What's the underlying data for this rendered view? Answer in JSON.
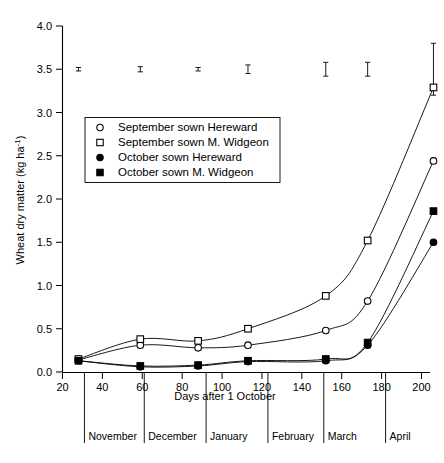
{
  "chart_data": {
    "type": "line",
    "title": "",
    "xlabel": "Days after 1 October",
    "ylabel": "Wheat dry matter (kg ha-1)",
    "ylabel_display": "Wheat dry matter (kg ha",
    "ylabel_exponent": "-1",
    "ylabel_tail": ")",
    "xlim": [
      20,
      210
    ],
    "ylim": [
      0.0,
      4.0
    ],
    "grid": false,
    "legend_position": "upper left inside",
    "xticks": [
      20,
      40,
      60,
      80,
      100,
      120,
      140,
      160,
      180,
      200
    ],
    "yticks": [
      "0.0",
      "0.5",
      "1.0",
      "1.5",
      "2.0",
      "2.5",
      "3.0",
      "3.5",
      "4.0"
    ],
    "ytick_values": [
      0.0,
      0.5,
      1.0,
      1.5,
      2.0,
      2.5,
      3.0,
      3.5,
      4.0
    ],
    "x": [
      28,
      59,
      88,
      113,
      152,
      173,
      206
    ],
    "series": [
      {
        "name": "September sown Hereward",
        "marker": "open-circle",
        "values": [
          0.14,
          0.31,
          0.28,
          0.31,
          0.48,
          0.82,
          2.44
        ]
      },
      {
        "name": "September sown M. Widgeon",
        "marker": "open-square",
        "values": [
          0.15,
          0.38,
          0.36,
          0.5,
          0.88,
          1.52,
          3.29
        ]
      },
      {
        "name": "October sown Hereward",
        "marker": "filled-circle",
        "values": [
          0.13,
          0.06,
          0.07,
          0.12,
          0.13,
          0.31,
          1.5
        ]
      },
      {
        "name": "October sown M. Widgeon",
        "marker": "filled-square",
        "values": [
          0.13,
          0.07,
          0.08,
          0.13,
          0.15,
          0.34,
          1.86
        ]
      }
    ],
    "error_bars": {
      "note": "SED bars plotted at y = 3.5",
      "y": 3.5,
      "x": [
        28,
        59,
        88,
        113,
        152,
        173,
        206
      ],
      "half_widths": [
        0.02,
        0.03,
        0.02,
        0.05,
        0.08,
        0.08,
        0.3
      ]
    },
    "month_bands": [
      {
        "label": "November",
        "start_day": 31,
        "end_day": 61
      },
      {
        "label": "December",
        "start_day": 61,
        "end_day": 92
      },
      {
        "label": "January",
        "start_day": 92,
        "end_day": 123
      },
      {
        "label": "February",
        "start_day": 123,
        "end_day": 151
      },
      {
        "label": "March",
        "start_day": 151,
        "end_day": 182
      },
      {
        "label": "April",
        "start_day": 182,
        "end_day": 212
      }
    ]
  },
  "legend": {
    "entries": [
      {
        "label": "September sown Hereward",
        "marker": "open-circle"
      },
      {
        "label": "September sown M. Widgeon",
        "marker": "open-square"
      },
      {
        "label": "October sown Hereward",
        "marker": "filled-circle"
      },
      {
        "label": "October sown M. Widgeon",
        "marker": "filled-square"
      }
    ]
  }
}
